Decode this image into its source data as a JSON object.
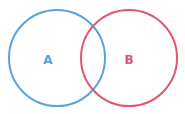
{
  "diagram": {
    "type": "venn",
    "sets": [
      {
        "label": "A",
        "color": "#5aa3d8"
      },
      {
        "label": "B",
        "color": "#e0566e"
      }
    ]
  }
}
